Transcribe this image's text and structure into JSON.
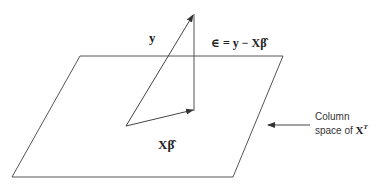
{
  "diagram": {
    "plane_label_line1": "Column",
    "plane_label_line2": "space of ",
    "plane_label_math": "X",
    "plane_label_sup": "T",
    "vector_y_label": "y",
    "residual_label": "∈ = y − Xβ̂",
    "projection_label": "Xβ̂",
    "colors": {
      "stroke": "#444444",
      "background": "#ffffff"
    }
  }
}
